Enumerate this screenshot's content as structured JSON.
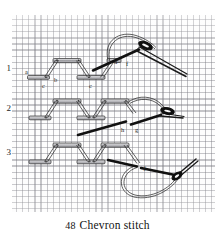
{
  "figure": {
    "caption_number": "48",
    "caption_title": "Chevron stitch",
    "row_labels": [
      "1",
      "2",
      "3"
    ]
  },
  "diagram": {
    "title": "Chevron stitch",
    "rows": [
      {
        "number": "1",
        "point_labels": [
          "a",
          "b",
          "c",
          "c",
          "d",
          "f"
        ],
        "elements": [
          "worked chevron stitches",
          "needle",
          "thread loop"
        ]
      },
      {
        "number": "2",
        "point_labels": [
          "h",
          "g"
        ],
        "elements": [
          "worked chevron stitches",
          "needle",
          "thread loop"
        ]
      },
      {
        "number": "3",
        "point_labels": [
          "j"
        ],
        "elements": [
          "worked chevron stitches",
          "needle",
          "thread loop"
        ]
      }
    ],
    "all_point_labels": [
      "a",
      "b",
      "c",
      "d",
      "f",
      "g",
      "h",
      "j"
    ]
  },
  "colors": {
    "ink": "#1a1a1a",
    "grid": "#7a7a80",
    "fabric": "#fdfdfd",
    "stitch_fill": "#c9c9cc",
    "page": "#ffffff"
  },
  "labels": {
    "a": "a",
    "b": "b",
    "c1": "c",
    "c2": "c",
    "d": "d",
    "f": "f",
    "g": "g",
    "h": "h",
    "j": "j"
  }
}
